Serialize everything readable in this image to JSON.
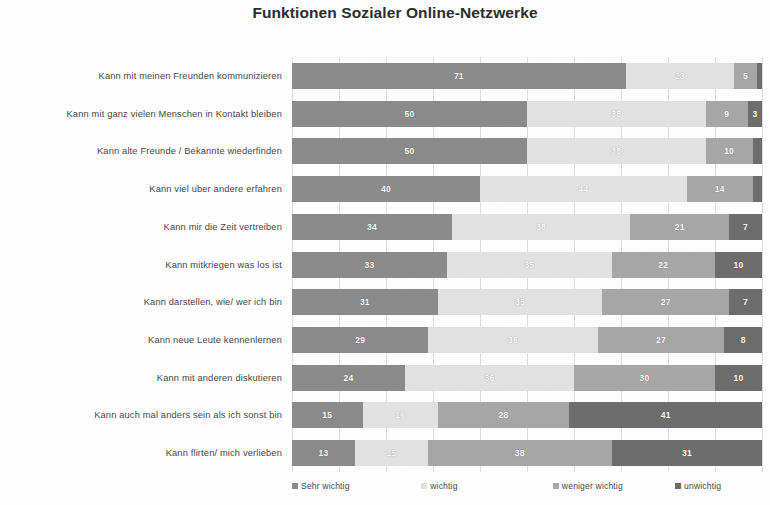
{
  "chart_data": {
    "type": "bar",
    "subtype": "stacked-bar-100-horizontal",
    "title": "Funktionen Sozialer Online-Netzwerke",
    "xlabel": "",
    "ylabel": "",
    "xlim": [
      0,
      100
    ],
    "grid": "vertical",
    "legend_position": "bottom",
    "categories": [
      "Kann mit meinen Freunden kommunizieren",
      "Kann mit ganz vielen Menschen in Kontakt bleiben",
      "Kann alte Freunde / Bekannte wiederfinden",
      "Kann viel uber andere erfahren",
      "Kann mir die Zeit vertreiben",
      "Kann mitkriegen was los ist",
      "Kann darstellen, wie/ wer ich bin",
      "Kann neue Leute kennenlernen",
      "Kann mit anderen diskutieren",
      "Kann auch mal anders sein als ich sonst bin",
      "Kann flirten/ mich verlieben"
    ],
    "series": [
      {
        "name": "Sehr wichtig",
        "color": "#8c8c8c",
        "values": [
          71,
          50,
          50,
          40,
          34,
          33,
          31,
          29,
          24,
          15,
          13
        ]
      },
      {
        "name": "wichtig",
        "color": "#e3e3e3",
        "values": [
          23,
          38,
          38,
          44,
          38,
          35,
          35,
          36,
          36,
          16,
          15
        ]
      },
      {
        "name": "weniger wichtig",
        "color": "#a8a8a8",
        "values": [
          5,
          9,
          10,
          14,
          21,
          22,
          27,
          27,
          30,
          28,
          38
        ]
      },
      {
        "name": "unwichtig",
        "color": "#6e6e6e",
        "values": [
          1,
          3,
          2,
          2,
          7,
          10,
          7,
          8,
          10,
          41,
          31
        ]
      }
    ],
    "gridline_values": [
      0,
      10,
      20,
      30,
      40,
      50,
      60,
      70,
      80,
      90,
      100
    ],
    "hidden_value_threshold": 3
  }
}
